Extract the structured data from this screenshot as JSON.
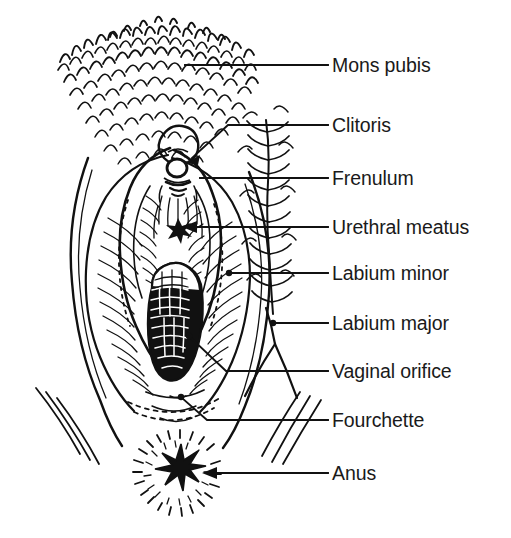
{
  "figure": {
    "style": "black ink line drawing on white background",
    "background_color": "#ffffff",
    "ink_color": "#111111",
    "label_color": "#1a1a1a",
    "width": 511,
    "height": 538
  },
  "labels": [
    {
      "id": "mons-pubis",
      "text": "Mons pubis",
      "text_x": 332,
      "text_y": 66,
      "leader": {
        "type": "line",
        "x1": 185,
        "y1": 65,
        "x2": 328,
        "y2": 65
      }
    },
    {
      "id": "clitoris",
      "text": "Clitoris",
      "text_x": 332,
      "text_y": 126,
      "leader": {
        "type": "arrow-bent",
        "x1": 328,
        "y1": 125,
        "bend_x": 228,
        "bend_y": 125,
        "x2": 189,
        "y2": 161
      }
    },
    {
      "id": "frenulum",
      "text": "Frenulum",
      "text_x": 332,
      "text_y": 179,
      "leader": {
        "type": "line",
        "x1": 200,
        "y1": 178,
        "x2": 328,
        "y2": 178
      }
    },
    {
      "id": "urethral-meatus",
      "text": "Urethral meatus",
      "text_x": 332,
      "text_y": 228,
      "leader": {
        "type": "arrow",
        "x1": 328,
        "y1": 227,
        "x2": 183,
        "y2": 227
      }
    },
    {
      "id": "labium-minor",
      "text": "Labium minor",
      "text_x": 332,
      "text_y": 274,
      "leader": {
        "type": "line-dot",
        "x1": 229,
        "y1": 273,
        "x2": 328,
        "y2": 273
      }
    },
    {
      "id": "labium-major",
      "text": "Labium major",
      "text_x": 332,
      "text_y": 324,
      "leader": {
        "type": "line-dot",
        "x1": 273,
        "y1": 323,
        "x2": 328,
        "y2": 323
      }
    },
    {
      "id": "vaginal-orifice",
      "text": "Vaginal orifice",
      "text_x": 332,
      "text_y": 372,
      "leader": {
        "type": "line-bent-dot",
        "x1": 328,
        "y1": 371,
        "bend_x": 226,
        "bend_y": 371,
        "x2": 188,
        "y2": 336
      }
    },
    {
      "id": "fourchette",
      "text": "Fourchette",
      "text_x": 332,
      "text_y": 421,
      "leader": {
        "type": "line-bent-dot",
        "x1": 328,
        "y1": 420,
        "bend_x": 207,
        "bend_y": 420,
        "x2": 180,
        "y2": 397
      }
    },
    {
      "id": "anus",
      "text": "Anus",
      "text_x": 332,
      "text_y": 474,
      "leader": {
        "type": "arrow",
        "x1": 328,
        "y1": 473,
        "x2": 203,
        "y2": 473
      }
    }
  ],
  "structures": [
    {
      "id": "mons-pubis-hair",
      "name": "Mons pubis with pubic hair"
    },
    {
      "id": "labia-majora",
      "name": "Labia majora outer folds"
    },
    {
      "id": "clitoris-body",
      "name": "Clitoris"
    },
    {
      "id": "frenulum-fold",
      "name": "Frenulum of clitoris"
    },
    {
      "id": "urethral-opening",
      "name": "Urethral meatus"
    },
    {
      "id": "labia-minora",
      "name": "Labia minora inner folds"
    },
    {
      "id": "vaginal-opening",
      "name": "Vaginal orifice"
    },
    {
      "id": "fourchette-fold",
      "name": "Fourchette / posterior commissure"
    },
    {
      "id": "anus-opening",
      "name": "Anus"
    },
    {
      "id": "thigh-creases",
      "name": "Thigh crease lines"
    }
  ]
}
